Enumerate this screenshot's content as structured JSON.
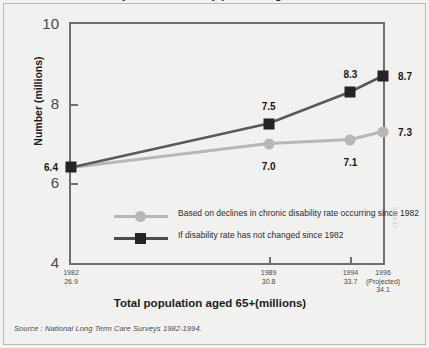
{
  "figure": {
    "cutoff_title": "Number of chronically disabled elderly persons aged 65+",
    "source_note": "Source : National Long Term Care Surveys 1982-1994.",
    "watermark": "JT 9810",
    "colors": {
      "background": "#f1f1f0",
      "frame": "#6e6e6e",
      "series_light": "#b7b7b5",
      "series_dark": "#242424",
      "text": "#1a1a1a"
    }
  },
  "chart_data": {
    "type": "line",
    "title": "",
    "xlabel": "Total population aged 65+(millions)",
    "ylabel": "Number (millions)",
    "ylim": [
      4,
      10
    ],
    "yticks": [
      "4",
      "6",
      "8",
      "10"
    ],
    "ytick_values": [
      4,
      6,
      8,
      10
    ],
    "grid": false,
    "legend_position": "inside-lower-left",
    "categories": [
      "1982",
      "1989",
      "1994",
      "1996"
    ],
    "x_positions": [
      0,
      0.6333,
      0.8958,
      1.0
    ],
    "xtick_labels": [
      {
        "year": "1982",
        "note": "",
        "population": "26.9"
      },
      {
        "year": "1989",
        "note": "",
        "population": "30.8"
      },
      {
        "year": "1994",
        "note": "",
        "population": "33.7"
      },
      {
        "year": "1996",
        "note": "(Projected)",
        "population": "34.1"
      }
    ],
    "series": [
      {
        "name": "Based on declines in chronic disability rate occurring since 1982",
        "marker": "circle",
        "color": "#b7b7b5",
        "values": [
          6.4,
          7.0,
          7.1,
          7.3
        ],
        "labels": [
          "6.4",
          "7.0",
          "7.1",
          "7.3"
        ]
      },
      {
        "name": "If disability rate has not changed since 1982",
        "marker": "square",
        "color": "#242424",
        "values": [
          6.4,
          7.5,
          8.3,
          8.7
        ],
        "labels": [
          "6.4",
          "7.5",
          "8.3",
          "8.7"
        ]
      }
    ]
  }
}
